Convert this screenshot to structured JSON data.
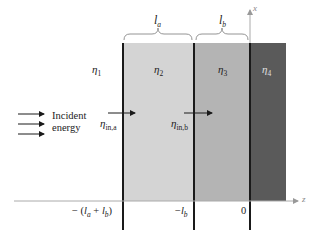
{
  "diagram": {
    "regions": [
      {
        "id": "eta1",
        "symbol": "η",
        "sub": "1",
        "color": "#ffffff"
      },
      {
        "id": "eta2",
        "symbol": "η",
        "sub": "2",
        "color": "#d4d4d4"
      },
      {
        "id": "eta3",
        "symbol": "η",
        "sub": "3",
        "color": "#b4b4b4"
      },
      {
        "id": "eta4",
        "symbol": "η",
        "sub": "4",
        "color": "#5a5a5a"
      }
    ],
    "thickness_labels": {
      "la": {
        "symbol": "l",
        "sub": "a"
      },
      "lb": {
        "symbol": "l",
        "sub": "b"
      }
    },
    "input_impedances": {
      "a": {
        "symbol": "η",
        "sub": "in,a"
      },
      "b": {
        "symbol": "η",
        "sub": "in,b"
      }
    },
    "incident": {
      "line1": "Incident",
      "line2": "energy"
    },
    "axes": {
      "x_label": "x",
      "z_label": "z"
    },
    "ticks": {
      "t1_prefix": "− (",
      "t1_l1": "l",
      "t1_s1": "a",
      "t1_plus": " + ",
      "t1_l2": "l",
      "t1_s2": "b",
      "t1_suffix": ")",
      "t2_prefix": "−",
      "t2_l": "l",
      "t2_s": "b",
      "t3": "0"
    }
  }
}
